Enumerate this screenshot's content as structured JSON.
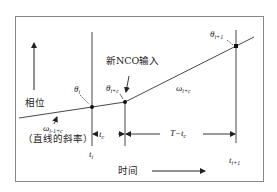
{
  "diagram": {
    "axes": {
      "y_label": "相位",
      "x_label": "时间"
    },
    "annotations": {
      "new_nco_input": "新NCO输入",
      "slope_note": "（直线的斜率）",
      "omega_prev": "ω",
      "omega_prev_sub": "i-1+c",
      "omega_next": "ω",
      "omega_next_sub": "i+c",
      "theta_i": "θ",
      "theta_i_sub": "i",
      "theta_ic": "θ",
      "theta_ic_sub": "i+c",
      "theta_i1": "θ",
      "theta_i1_sub": "i+1",
      "t_i": "t",
      "t_i_sub": "i",
      "t_i1": "t",
      "t_i1_sub": "i+1",
      "t_c": "t",
      "t_c_sub": "c",
      "T_minus_tc": "T−t",
      "T_minus_tc_sub": "c"
    },
    "points": [
      {
        "name": "theta_i",
        "x": 92,
        "y": 107
      },
      {
        "name": "theta_i+c",
        "x": 125,
        "y": 102
      },
      {
        "name": "theta_i+1",
        "x": 236,
        "y": 46
      }
    ],
    "colors": {
      "frame": "#777777",
      "line": "#333333",
      "text": "#222222"
    }
  }
}
